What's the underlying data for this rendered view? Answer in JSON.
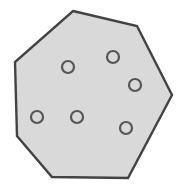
{
  "figure": {
    "name": "heptagon-with-dots",
    "type": "polygon-with-markers",
    "canvas": {
      "width": 192,
      "height": 190,
      "background": "#ffffff"
    },
    "polygon": {
      "name": "heptagon",
      "sides": 7,
      "fill_color": "#d9d9d9",
      "stroke_color": "#434343",
      "stroke_width": 2.4,
      "points": "73,11 137,26 172,95 128,178 52,177 17,136 15,62",
      "vertices": [
        {
          "label": "top",
          "x": 73,
          "y": 11
        },
        {
          "label": "top-right",
          "x": 137,
          "y": 26
        },
        {
          "label": "right",
          "x": 172,
          "y": 95
        },
        {
          "label": "bottom-right",
          "x": 128,
          "y": 178
        },
        {
          "label": "bottom-left",
          "x": 52,
          "y": 177
        },
        {
          "label": "left-lower",
          "x": 17,
          "y": 136
        },
        {
          "label": "left-upper",
          "x": 15,
          "y": 62
        }
      ]
    },
    "dots": {
      "count": 6,
      "radius": 6,
      "stroke_color": "#555555",
      "stroke_width": 2.2,
      "fill_color": "none",
      "items": [
        {
          "label": "dot-1",
          "x": 68,
          "y": 67
        },
        {
          "label": "dot-2",
          "x": 113,
          "y": 57
        },
        {
          "label": "dot-3",
          "x": 135,
          "y": 85
        },
        {
          "label": "dot-4",
          "x": 37,
          "y": 117
        },
        {
          "label": "dot-5",
          "x": 77,
          "y": 117
        },
        {
          "label": "dot-6",
          "x": 126,
          "y": 128
        }
      ]
    }
  }
}
